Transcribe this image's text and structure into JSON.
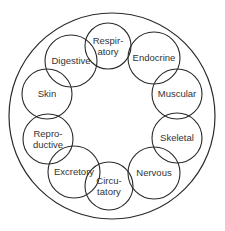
{
  "diagram": {
    "title": "",
    "outer_circle": {
      "cx": 112,
      "cy": 116,
      "r": 103
    },
    "stroke_color": "#2a2a2a",
    "text_color": "#333333",
    "nodes": [
      {
        "id": "respiratory",
        "lines": [
          "Respir-",
          "atory"
        ],
        "cx": 108,
        "cy": 46,
        "r": 23
      },
      {
        "id": "endocrine",
        "lines": [
          "Endocrine"
        ],
        "cx": 154,
        "cy": 58,
        "r": 26
      },
      {
        "id": "muscular",
        "lines": [
          "Muscular"
        ],
        "cx": 177,
        "cy": 94,
        "r": 25
      },
      {
        "id": "skeletal",
        "lines": [
          "Skeletal"
        ],
        "cx": 177,
        "cy": 138,
        "r": 25
      },
      {
        "id": "nervous",
        "lines": [
          "Nervous"
        ],
        "cx": 154,
        "cy": 173,
        "r": 26
      },
      {
        "id": "circulatory",
        "lines": [
          "Circu-",
          "tatory"
        ],
        "cx": 109,
        "cy": 186,
        "r": 24
      },
      {
        "id": "excretory",
        "lines": [
          "Excretory"
        ],
        "cx": 74,
        "cy": 172,
        "r": 26
      },
      {
        "id": "reproductive",
        "lines": [
          "Repro-",
          "ductive"
        ],
        "cx": 48,
        "cy": 139,
        "r": 25
      },
      {
        "id": "skin",
        "lines": [
          "Skin"
        ],
        "cx": 47,
        "cy": 94,
        "r": 25
      },
      {
        "id": "digestive",
        "lines": [
          "Digestive"
        ],
        "cx": 71,
        "cy": 61,
        "r": 26
      }
    ]
  }
}
